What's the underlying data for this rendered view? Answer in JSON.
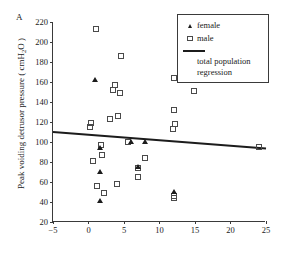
{
  "panel": {
    "label": "A"
  },
  "axes": {
    "ylabel_text": "Peak voiding detrusor pressure ( cmH",
    "ylabel_sub": "2",
    "ylabel_tail": "O )",
    "ylabel_full": "Peak voiding detrusor pressure ( cmH2O )",
    "xlabel": "",
    "yticks": [
      20,
      40,
      60,
      80,
      100,
      120,
      140,
      160,
      180,
      200,
      220
    ],
    "xticks": [
      -5,
      0,
      5,
      10,
      15,
      20,
      25
    ]
  },
  "legend": {
    "items": [
      {
        "key": "filled-triangle",
        "label": "female"
      },
      {
        "key": "open-square",
        "label": "male"
      },
      {
        "key": "solid-line",
        "label": "total population"
      },
      {
        "key": "solid-line-cont",
        "label": "regression"
      }
    ]
  },
  "colors": {
    "axis": "#3a3a3a",
    "male_marker": "#4a4a4a",
    "female_marker": "#1c1c1c",
    "regression_line": "#1c1c1c",
    "background": "#ffffff"
  },
  "chart_data": {
    "type": "scatter",
    "title": "",
    "panel_label": "A",
    "xlabel": "",
    "ylabel": "Peak voiding detrusor pressure ( cmH2O )",
    "xlim": [
      -5,
      25
    ],
    "ylim": [
      20,
      220
    ],
    "xticks": [
      -5,
      0,
      5,
      10,
      15,
      20,
      25
    ],
    "yticks": [
      20,
      40,
      60,
      80,
      100,
      120,
      140,
      160,
      180,
      200,
      220
    ],
    "grid": false,
    "legend_position": "top-right",
    "series": [
      {
        "name": "male",
        "marker": "open-square",
        "points": [
          [
            1.1,
            213.5
          ],
          [
            4.6,
            186.5
          ],
          [
            12.0,
            164.5
          ],
          [
            3.7,
            157.0
          ],
          [
            3.4,
            152.5
          ],
          [
            14.9,
            151.5
          ],
          [
            4.5,
            149.0
          ],
          [
            12.0,
            132.5
          ],
          [
            4.1,
            126.5
          ],
          [
            3.0,
            123.5
          ],
          [
            0.3,
            119.5
          ],
          [
            12.2,
            118.0
          ],
          [
            0.2,
            115.5
          ],
          [
            11.9,
            113.5
          ],
          [
            5.6,
            100.5
          ],
          [
            1.7,
            97.5
          ],
          [
            1.9,
            87.0
          ],
          [
            8.0,
            84.5
          ],
          [
            0.6,
            81.5
          ],
          [
            24.0,
            95.5
          ],
          [
            7.0,
            74.0
          ],
          [
            7.0,
            65.5
          ],
          [
            4.0,
            58.5
          ],
          [
            1.2,
            56.5
          ],
          [
            2.2,
            49.0
          ],
          [
            12.0,
            46.0
          ],
          [
            12.0,
            44.5
          ]
        ]
      },
      {
        "name": "female",
        "marker": "filled-triangle",
        "points": [
          [
            1.0,
            161.5
          ],
          [
            6.0,
            100.0
          ],
          [
            8.0,
            99.5
          ],
          [
            1.6,
            93.5
          ],
          [
            1.7,
            69.5
          ],
          [
            7.0,
            75.0
          ],
          [
            1.7,
            40.5
          ],
          [
            12.0,
            49.5
          ]
        ]
      }
    ],
    "regression": {
      "name": "total population regression",
      "x": [
        -5,
        25
      ],
      "y": [
        110.0,
        93.5
      ]
    }
  }
}
